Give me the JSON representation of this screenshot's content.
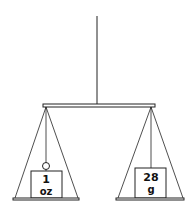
{
  "diagram": {
    "type": "balance-scale",
    "left_pan": {
      "weight_value": "1",
      "weight_unit": "oz"
    },
    "right_pan": {
      "weight_value": "28",
      "weight_unit": "g"
    },
    "colors": {
      "line": "#222222",
      "background": "#ffffff"
    }
  }
}
